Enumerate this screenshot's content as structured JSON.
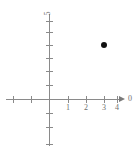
{
  "chart_data": {
    "type": "scatter",
    "title": "",
    "xlabel": "0",
    "ylabel": "5",
    "xlim": [
      -2.5,
      4.5
    ],
    "ylim": [
      -6,
      6
    ],
    "grid": false,
    "legend": null,
    "x_ticks": [
      -2,
      -1,
      1,
      2,
      3,
      4
    ],
    "x_tick_labels": [
      "",
      "",
      "1",
      "2",
      "3",
      "4"
    ],
    "y_ticks": [
      -5,
      -4,
      -3,
      -2,
      -1,
      1,
      2,
      3,
      4,
      5
    ],
    "y_tick_labels": [
      "",
      "",
      "",
      "",
      "",
      "",
      "",
      "",
      "",
      ""
    ],
    "points": [
      {
        "x": 3,
        "y": 4,
        "label": ""
      }
    ]
  },
  "axes": {
    "x_axis_name": "0",
    "y_axis_name": "5",
    "x_labels": [
      {
        "value": 1,
        "text": "1"
      },
      {
        "value": 2,
        "text": "2"
      },
      {
        "value": 3,
        "text": "3"
      },
      {
        "value": 4,
        "text": "4"
      }
    ]
  },
  "colors": {
    "axis": "#8a8a8a",
    "tick_text": "#6f6f6f",
    "point": "#111111",
    "background": "#ffffff"
  }
}
